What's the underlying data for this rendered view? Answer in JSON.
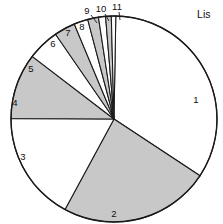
{
  "chart_data": {
    "type": "pie",
    "title": "",
    "subtitle": "",
    "xlabel": "",
    "ylabel": "",
    "legend_position": "none",
    "grid": false,
    "center": {
      "x": 114,
      "y": 119
    },
    "radius": 103,
    "start_angle_deg": 1,
    "direction": "clockwise",
    "colors": {
      "fill_gray": "#c8c8c8",
      "fill_white": "#ffffff",
      "outline": "#1a1a1a",
      "text": "#101010"
    },
    "categories": [
      "1",
      "2",
      "3",
      "4",
      "5",
      "6",
      "7",
      "8",
      "9",
      "10",
      "11"
    ],
    "values": [
      34.0,
      23.6,
      17.2,
      10.3,
      5.0,
      3.3,
      2.2,
      1.7,
      1.1,
      0.9,
      0.7
    ],
    "units": "percent",
    "slices": [
      {
        "label": "1",
        "value": 34.0,
        "start_deg": 1.0,
        "end_deg": 123.4,
        "fill": "#ffffff",
        "label_x": 196,
        "label_y": 100,
        "leader": false
      },
      {
        "label": "2",
        "value": 23.6,
        "start_deg": 123.4,
        "end_deg": 208.4,
        "fill": "#c8c8c8",
        "label_x": 114,
        "label_y": 214,
        "leader": false
      },
      {
        "label": "3",
        "value": 17.2,
        "start_deg": 208.4,
        "end_deg": 270.3,
        "fill": "#ffffff",
        "label_x": 23,
        "label_y": 157,
        "leader": false
      },
      {
        "label": "4",
        "value": 10.3,
        "start_deg": 270.3,
        "end_deg": 307.4,
        "fill": "#c8c8c8",
        "label_x": 15,
        "label_y": 103,
        "leader": false
      },
      {
        "label": "5",
        "value": 5.0,
        "start_deg": 307.4,
        "end_deg": 325.4,
        "fill": "#ffffff",
        "label_x": 31,
        "label_y": 69,
        "leader": false
      },
      {
        "label": "6",
        "value": 3.3,
        "start_deg": 325.4,
        "end_deg": 337.3,
        "fill": "#c8c8c8",
        "label_x": 53,
        "label_y": 44,
        "leader": false
      },
      {
        "label": "7",
        "value": 2.2,
        "start_deg": 337.3,
        "end_deg": 345.2,
        "fill": "#ffffff",
        "label_x": 68,
        "label_y": 33,
        "leader": false
      },
      {
        "label": "8",
        "value": 1.7,
        "start_deg": 345.2,
        "end_deg": 351.3,
        "fill": "#c8c8c8",
        "label_x": 82,
        "label_y": 27,
        "leader": false
      },
      {
        "label": "9",
        "value": 1.1,
        "start_deg": 351.3,
        "end_deg": 355.3,
        "fill": "#ffffff",
        "label_x": 87,
        "label_y": 11,
        "leader": true,
        "leader_x1": 91,
        "leader_y1": 15,
        "leader_x2": 97,
        "leader_y2": 23
      },
      {
        "label": "10",
        "value": 0.9,
        "start_deg": 355.3,
        "end_deg": 358.5,
        "fill": "#c8c8c8",
        "label_x": 101,
        "label_y": 9,
        "leader": true,
        "leader_x1": 105,
        "leader_y1": 14,
        "leader_x2": 109,
        "leader_y2": 21
      },
      {
        "label": "11",
        "value": 0.7,
        "start_deg": 358.5,
        "end_deg": 361.0,
        "fill": "#ffffff",
        "label_x": 117,
        "label_y": 7,
        "leader": true,
        "leader_x1": 119,
        "leader_y1": 12,
        "leader_x2": 120,
        "leader_y2": 20
      }
    ]
  },
  "annotations": {
    "side_text": "Lis",
    "side_text_x": 197,
    "side_text_y": 8
  }
}
